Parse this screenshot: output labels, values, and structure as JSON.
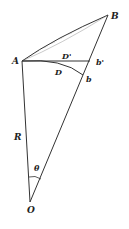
{
  "diagram": {
    "type": "geometry",
    "points": {
      "A": {
        "label": "A",
        "x": 22,
        "y": 61
      },
      "B": {
        "label": "B",
        "x": 108,
        "y": 15
      },
      "O": {
        "label": "O",
        "x": 30,
        "y": 202
      },
      "b_prime": {
        "label": "b'",
        "x": 90,
        "y": 61
      },
      "b": {
        "label": "b",
        "x": 83,
        "y": 75
      }
    },
    "labels": {
      "A": "A",
      "B": "B",
      "O": "O",
      "D_prime": "D'",
      "b_prime": "b'",
      "D": "D",
      "b": "b",
      "R": "R",
      "theta": "θ"
    },
    "colors": {
      "line": "#333333",
      "hatch": "#555555",
      "background": "#ffffff"
    }
  }
}
